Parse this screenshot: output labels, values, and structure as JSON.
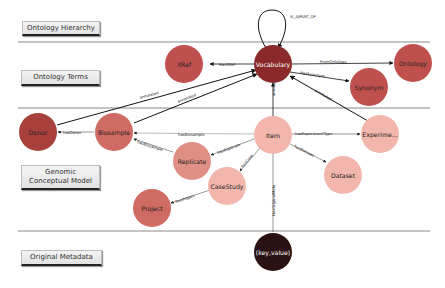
{
  "layers": [
    {
      "id": "hierarchy",
      "label": "Ontology Hierarchy"
    },
    {
      "id": "terms",
      "label": "Ontology Terms"
    },
    {
      "id": "gcm",
      "label": "Genomic Conceptual Model"
    },
    {
      "id": "original",
      "label": "Original Metadata"
    }
  ],
  "nodes": {
    "vocabulary": {
      "label": "Vocabulary",
      "color": "#8b2a2a"
    },
    "xref": {
      "label": "XRef",
      "color": "#c0504d"
    },
    "ontology": {
      "label": "Ontology",
      "color": "#c0504d"
    },
    "synonym": {
      "label": "Synonym",
      "color": "#c0504d"
    },
    "donor": {
      "label": "Donor",
      "color": "#a8413c"
    },
    "biosample": {
      "label": "Biosample",
      "color": "#cf6b63"
    },
    "item": {
      "label": "Item",
      "color": "#f2b6ad"
    },
    "experiment": {
      "label": "Experime...",
      "color": "#f2b6ad"
    },
    "replicate": {
      "label": "Replicate",
      "color": "#e08f84"
    },
    "dataset": {
      "label": "Dataset",
      "color": "#f2b6ad"
    },
    "casestudy": {
      "label": "CaseStudy",
      "color": "#f2b6ad"
    },
    "project": {
      "label": "Project",
      "color": "#cf6b63"
    },
    "keyvalue": {
      "label": "(key,value)",
      "color": "#2a1212"
    }
  },
  "edges": {
    "is_a_part_of": "IS_A|PART_OF",
    "has_xref": "HasXRef",
    "from_ontology": "FromOntology",
    "has_synonym": "HasSynonym",
    "annotated_donor": "annotated",
    "annotated_biosample": "annotated",
    "annotated_item": "annotated",
    "annotated_experiment": "annotated",
    "has_donor": "hasDonor",
    "has_biosample_item": "hasBiosample",
    "has_biosample_replicate": "hasBiosample",
    "has_replicate": "hasReplicate",
    "has_experiment_type": "hasExperimentType",
    "has_dataset": "hasDataset",
    "has_case": "hasCase",
    "has_project": "hasProject",
    "has_original_meta": "HasOriginalMeta"
  }
}
